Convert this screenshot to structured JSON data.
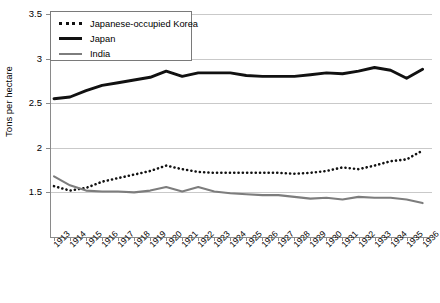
{
  "chart_data": {
    "type": "line",
    "title": "",
    "xlabel": "",
    "ylabel": "Tons per hectare",
    "ylim": [
      1.0,
      3.5
    ],
    "yticks": [
      1.5,
      2,
      2.5,
      3,
      3.5
    ],
    "ytick_labels": [
      "1.5",
      "2",
      "2.5",
      "3",
      "3.5"
    ],
    "grid": true,
    "legend_position": "top-left-inside",
    "categories": [
      1913,
      1914,
      1915,
      1916,
      1917,
      1918,
      1919,
      1920,
      1921,
      1922,
      1923,
      1924,
      1925,
      1926,
      1927,
      1928,
      1929,
      1930,
      1931,
      1932,
      1933,
      1934,
      1935,
      1936
    ],
    "xtick_labels": [
      "1913",
      "1914",
      "1915",
      "1916",
      "1917",
      "1918",
      "1919",
      "1920",
      "1921",
      "1922",
      "1923",
      "1924",
      "1925",
      "1926",
      "1927",
      "1928",
      "1929",
      "1930",
      "1931",
      "1932",
      "1933",
      "1934",
      "1935",
      "1936"
    ],
    "series": [
      {
        "name": "Japanese-occupied Korea",
        "style": "dotted",
        "color": "#111111",
        "values": [
          1.57,
          1.52,
          1.55,
          1.62,
          1.66,
          1.7,
          1.74,
          1.8,
          1.76,
          1.73,
          1.72,
          1.72,
          1.72,
          1.72,
          1.72,
          1.71,
          1.72,
          1.74,
          1.78,
          1.76,
          1.8,
          1.85,
          1.87,
          1.97
        ]
      },
      {
        "name": "Japan",
        "style": "solid-thick",
        "color": "#111111",
        "values": [
          2.55,
          2.57,
          2.64,
          2.7,
          2.73,
          2.76,
          2.79,
          2.86,
          2.8,
          2.84,
          2.84,
          2.84,
          2.81,
          2.8,
          2.8,
          2.8,
          2.82,
          2.84,
          2.83,
          2.86,
          2.9,
          2.87,
          2.78,
          2.88
        ]
      },
      {
        "name": "India",
        "style": "solid-gray",
        "color": "#7d7d7d",
        "values": [
          1.68,
          1.58,
          1.52,
          1.51,
          1.51,
          1.5,
          1.52,
          1.56,
          1.51,
          1.56,
          1.51,
          1.49,
          1.48,
          1.47,
          1.47,
          1.45,
          1.43,
          1.44,
          1.42,
          1.45,
          1.44,
          1.44,
          1.42,
          1.38
        ]
      }
    ]
  },
  "legend": {
    "items": [
      {
        "label": "Japanese-occupied Korea",
        "swatch": "dotted-line-swatch"
      },
      {
        "label": "Japan",
        "swatch": "thick-black-line-swatch"
      },
      {
        "label": "India",
        "swatch": "gray-line-swatch"
      }
    ]
  },
  "axes": {
    "y_title": "Tons per hectare"
  }
}
